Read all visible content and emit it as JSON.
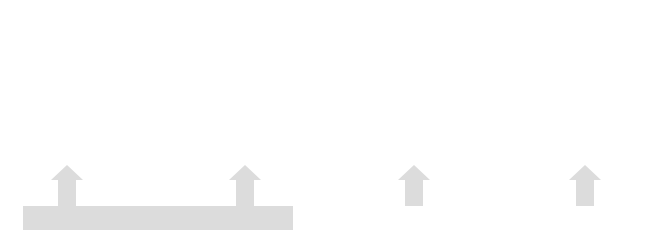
{
  "colors": {
    "curve": "#6e6e6e",
    "filled_point": "#7a7a7a",
    "axis": "#333333",
    "band": "#dcdcdc",
    "band_dark": "#c8c8c8",
    "vband": "#e6e6e6",
    "arrow": "#dcdcdc"
  },
  "panels": [
    {
      "id": "panel-1",
      "y_axis_label": "f(x)",
      "x_axis_label": "x",
      "labels": {
        "c": "c",
        "L": "L",
        "eps_top": "ε",
        "eps_bottom": "ε"
      }
    },
    {
      "id": "panel-2",
      "y_axis_label": "f(x)",
      "x_axis_label": "x",
      "labels": {
        "c": "c",
        "L": "L",
        "delta_left": "δ",
        "delta_right": "δ"
      }
    },
    {
      "id": "panel-3",
      "y_axis_label": "f(x)",
      "x_axis_label": "x",
      "labels": {
        "c_minus_delta": "c − δ",
        "c": "c",
        "c_plus_delta": "c + δ",
        "L": "L"
      }
    },
    {
      "id": "panel-4",
      "y_axis_label": "f(x)",
      "x_axis_label": "x",
      "labels": {
        "L_plus_eps": "L + ε",
        "L": "L",
        "L_minus_eps": "L − ε",
        "c": "c"
      }
    }
  ],
  "statement": {
    "part1_prefix": "For each",
    "part1_math": "ε > 0",
    "part2_prefix": "there is a",
    "part2_math": "δ > 0",
    "part2_suffix": "such that",
    "part3": "0 < |x − c| < δ",
    "implies": "⟹",
    "part4": "|f(x) − L| < ε"
  }
}
